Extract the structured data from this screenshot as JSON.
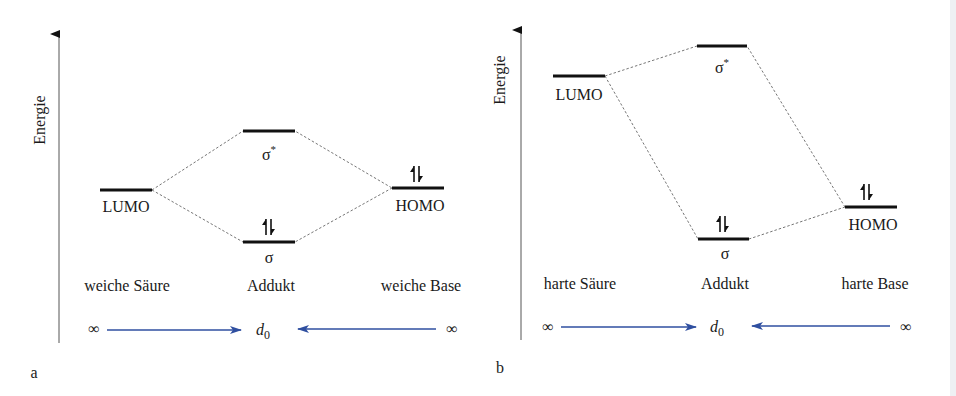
{
  "figure": {
    "panels": [
      {
        "id": "a",
        "panel_label": "a",
        "axis_label": "Energie",
        "acid": {
          "label": "LUMO",
          "column_label": "weiche Säure"
        },
        "adduct": {
          "upper": "σ",
          "upper_sup": "*",
          "lower": "σ",
          "column_label": "Addukt"
        },
        "base": {
          "label": "HOMO",
          "column_label": "weiche Base"
        },
        "distance": {
          "left": "∞",
          "center": "d",
          "center_sub": "0",
          "right": "∞"
        },
        "electron_pairs": [
          "HOMO",
          "σ"
        ]
      },
      {
        "id": "b",
        "panel_label": "b",
        "axis_label": "Energie",
        "acid": {
          "label": "LUMO",
          "column_label": "harte Säure"
        },
        "adduct": {
          "upper": "σ",
          "upper_sup": "*",
          "lower": "σ",
          "column_label": "Addukt"
        },
        "base": {
          "label": "HOMO",
          "column_label": "harte Base"
        },
        "distance": {
          "left": "∞",
          "center": "d",
          "center_sub": "0",
          "right": "∞"
        },
        "electron_pairs": [
          "HOMO",
          "σ"
        ]
      }
    ],
    "electron_pair_glyph": "↿⇂",
    "colors": {
      "levels": "#111111",
      "correlation_lines": "#666666",
      "distance_arrows": "#2f4fa0"
    }
  }
}
